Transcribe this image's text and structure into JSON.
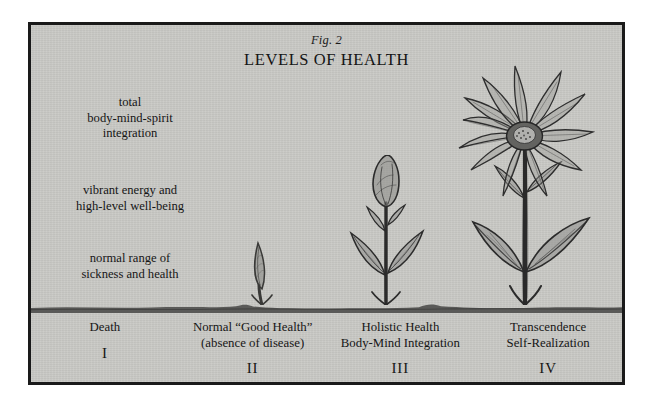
{
  "figure": {
    "number": "Fig. 2",
    "title": "LEVELS OF HEALTH",
    "frame_color": "#1a1a1a",
    "panel_color": "#c9c9c5",
    "ink_color": "#161616",
    "ground_color": "#5a5a58"
  },
  "tier_labels": [
    {
      "name": "tier-total-integration",
      "lines": [
        "total",
        "body-mind-spirit",
        "integration"
      ]
    },
    {
      "name": "tier-vibrant-energy",
      "lines": [
        "vibrant energy and",
        "high-level well-being"
      ]
    },
    {
      "name": "tier-normal-range",
      "lines": [
        "normal range of",
        "sickness and health"
      ]
    }
  ],
  "stages": [
    {
      "name": "stage-death",
      "roman": "I",
      "lines": [
        "Death"
      ],
      "illustration": "bare-ground"
    },
    {
      "name": "stage-normal-good-health",
      "roman": "II",
      "lines": [
        "Normal “Good Health”",
        "(absence of disease)"
      ],
      "illustration": "sprout-shoot"
    },
    {
      "name": "stage-holistic-health",
      "roman": "III",
      "lines": [
        "Holistic Health",
        "Body-Mind Integration"
      ],
      "illustration": "budding-plant"
    },
    {
      "name": "stage-transcendence",
      "roman": "IV",
      "lines": [
        "Transcendence",
        "Self-Realization"
      ],
      "illustration": "blooming-flower"
    }
  ]
}
